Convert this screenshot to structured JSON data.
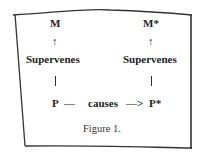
{
  "figure": {
    "caption": "Figure 1.",
    "left_column": {
      "top": "M",
      "arrow": "↑",
      "relation": "Supervenes",
      "base": "P"
    },
    "right_column": {
      "top": "M*",
      "arrow": "↑",
      "relation": "Supervenes",
      "base": "P*"
    },
    "bottom_relation": {
      "dash": "—",
      "label": "causes",
      "arrow": "—>"
    }
  }
}
